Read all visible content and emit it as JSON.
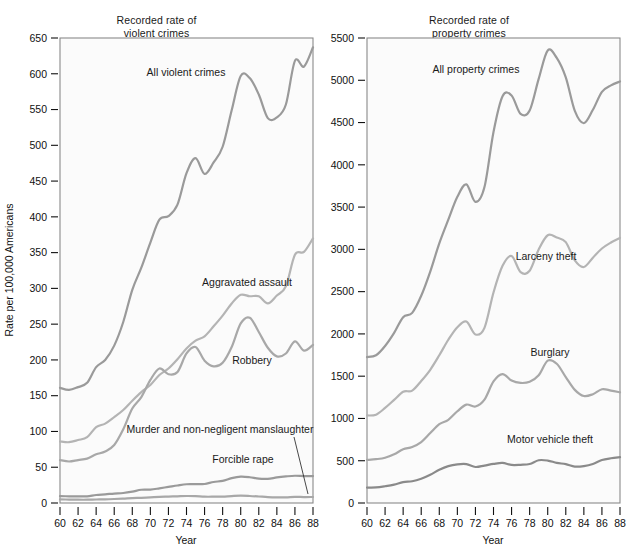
{
  "figure": {
    "width": 642,
    "height": 551,
    "background": "#ffffff",
    "ylabel": "Rate per 100,000 Americans",
    "xlabel_left": "Year",
    "xlabel_right": "Year"
  },
  "panels": {
    "violent": {
      "title_line1": "Recorded rate of",
      "title_line2": "violent crimes",
      "xlabel": "Year"
    },
    "property": {
      "title_line1": "Recorded rate of",
      "title_line2": "property crimes",
      "xlabel": "Year"
    }
  },
  "labels": {
    "all_violent_crimes": "All violent crimes",
    "aggravated_assault": "Aggravated assault",
    "robbery": "Robbery",
    "murder": "Murder and non-negligent manslaughter",
    "forcible_rape": "Forcible rape",
    "all_property_crimes": "All property crimes",
    "larceny_theft": "Larceny theft",
    "burglary": "Burglary",
    "motor_vehicle_theft": "Motor vehicle theft"
  },
  "chart_data": [
    {
      "type": "line",
      "id": "violent",
      "title": "Recorded rate of violent crimes",
      "xlabel": "Year",
      "ylabel": "Rate per 100,000 Americans",
      "xlim": [
        60,
        88
      ],
      "ylim": [
        0,
        650
      ],
      "ytick_step": 50,
      "xtick_step": 2,
      "grid": false,
      "legend": "inline-annotations",
      "yticks": [
        0,
        50,
        100,
        150,
        200,
        250,
        300,
        350,
        400,
        450,
        500,
        550,
        600,
        650
      ],
      "xticks": [
        60,
        62,
        64,
        66,
        68,
        70,
        72,
        74,
        76,
        78,
        80,
        82,
        84,
        86,
        88
      ],
      "x": [
        60,
        61,
        62,
        63,
        64,
        65,
        66,
        67,
        68,
        69,
        70,
        71,
        72,
        73,
        74,
        75,
        76,
        77,
        78,
        79,
        80,
        81,
        82,
        83,
        84,
        85,
        86,
        87,
        88
      ],
      "series": [
        {
          "name": "All violent crimes",
          "color": "#9a9a9a",
          "values": [
            161,
            158,
            162,
            168,
            190,
            200,
            220,
            253,
            298,
            329,
            364,
            396,
            401,
            417,
            461,
            482,
            460,
            476,
            498,
            549,
            597,
            594,
            571,
            538,
            539,
            557,
            618,
            610,
            637
          ]
        },
        {
          "name": "Aggravated assault",
          "color": "#b4b4b4",
          "values": [
            86,
            85,
            88,
            92,
            106,
            111,
            120,
            130,
            143,
            155,
            165,
            179,
            188,
            201,
            216,
            227,
            233,
            247,
            262,
            279,
            291,
            289,
            289,
            279,
            290,
            303,
            347,
            351,
            370
          ]
        },
        {
          "name": "Robbery",
          "color": "#a8a8a8",
          "values": [
            60,
            58,
            60,
            62,
            68,
            72,
            81,
            103,
            132,
            148,
            172,
            188,
            180,
            183,
            209,
            218,
            199,
            191,
            196,
            218,
            251,
            259,
            239,
            217,
            205,
            209,
            226,
            213,
            221
          ]
        },
        {
          "name": "Forcible rape",
          "color": "#9a9a9a",
          "values": [
            9.6,
            9.4,
            9.4,
            9.4,
            11.2,
            12.1,
            13.2,
            14.0,
            15.9,
            18.5,
            18.7,
            20.5,
            22.5,
            24.5,
            26.2,
            26.3,
            26.6,
            29.4,
            31.0,
            34.7,
            36.8,
            36.0,
            34.0,
            33.8,
            35.7,
            37.1,
            38.1,
            37.6,
            37.6
          ]
        },
        {
          "name": "Murder and non-negligent manslaughter",
          "color": "#a8a8a8",
          "values": [
            5.1,
            4.8,
            4.6,
            4.6,
            4.9,
            5.1,
            5.6,
            6.2,
            6.9,
            7.3,
            7.9,
            8.6,
            9.0,
            9.4,
            9.8,
            9.6,
            8.8,
            8.8,
            9.0,
            9.7,
            10.2,
            9.8,
            9.1,
            8.3,
            7.9,
            7.9,
            8.6,
            8.3,
            8.4
          ]
        }
      ]
    },
    {
      "type": "line",
      "id": "property",
      "title": "Recorded rate of property crimes",
      "xlabel": "Year",
      "ylabel": "Rate per 100,000 Americans",
      "xlim": [
        60,
        88
      ],
      "ylim": [
        0,
        5500
      ],
      "ytick_step": 500,
      "xtick_step": 2,
      "grid": false,
      "legend": "inline-annotations",
      "yticks": [
        0,
        500,
        1000,
        1500,
        2000,
        2500,
        3000,
        3500,
        4000,
        4500,
        5000,
        5500
      ],
      "xticks": [
        60,
        62,
        64,
        66,
        68,
        70,
        72,
        74,
        76,
        78,
        80,
        82,
        84,
        86,
        88
      ],
      "x": [
        60,
        61,
        62,
        63,
        64,
        65,
        66,
        67,
        68,
        69,
        70,
        71,
        72,
        73,
        74,
        75,
        76,
        77,
        78,
        79,
        80,
        81,
        82,
        83,
        84,
        85,
        86,
        87,
        88
      ],
      "series": [
        {
          "name": "All property crimes",
          "color": "#9a9a9a",
          "values": [
            1726,
            1747,
            1857,
            2012,
            2198,
            2249,
            2451,
            2737,
            3071,
            3351,
            3621,
            3769,
            3561,
            3737,
            4389,
            4811,
            4820,
            4602,
            4643,
            5017,
            5353,
            5264,
            5033,
            4637,
            4492,
            4651,
            4863,
            4940,
            4986
          ]
        },
        {
          "name": "Larceny theft",
          "color": "#b4b4b4",
          "values": [
            1035,
            1045,
            1124,
            1219,
            1316,
            1329,
            1443,
            1576,
            1747,
            1931,
            2079,
            2146,
            1994,
            2072,
            2490,
            2805,
            2921,
            2730,
            2747,
            2999,
            3167,
            3140,
            3085,
            2869,
            2791,
            2901,
            3010,
            3081,
            3135
          ]
        },
        {
          "name": "Burglary",
          "color": "#a8a8a8",
          "values": [
            509,
            518,
            535,
            576,
            635,
            663,
            721,
            827,
            932,
            984,
            1085,
            1164,
            1141,
            1223,
            1438,
            1525,
            1448,
            1420,
            1434,
            1511,
            1684,
            1647,
            1489,
            1338,
            1265,
            1287,
            1345,
            1330,
            1309
          ]
        },
        {
          "name": "Motor vehicle theft",
          "color": "#8a8a8a",
          "values": [
            183,
            184,
            198,
            217,
            247,
            257,
            287,
            334,
            393,
            436,
            457,
            460,
            426,
            443,
            462,
            474,
            450,
            452,
            461,
            506,
            502,
            475,
            459,
            431,
            437,
            462,
            508,
            529,
            543
          ]
        }
      ],
      "annotations": [
        {
          "text": "All property crimes",
          "x": 72,
          "y": 5080
        },
        {
          "text": "Larceny theft",
          "x": 78.5,
          "y": 3300
        },
        {
          "text": "Burglary",
          "x": 79,
          "y": 1800
        },
        {
          "text": "Motor vehicle theft",
          "x": 79,
          "y": 700
        }
      ]
    }
  ]
}
